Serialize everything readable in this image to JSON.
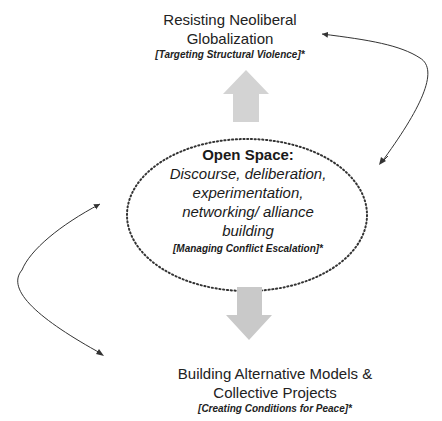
{
  "diagram": {
    "top_node": {
      "title_line1": "Resisting Neoliberal",
      "title_line2": "Globalization",
      "subtitle": "[Targeting Structural Violence]*"
    },
    "center_node": {
      "heading": "Open Space:",
      "body_line1": "Discourse, deliberation,",
      "body_line2": "experimentation,",
      "body_line3": "networking/ alliance",
      "body_line4": "building",
      "subtitle": "[Managing Conflict Escalation]*"
    },
    "bottom_node": {
      "title_line1": "Building Alternative Models &",
      "title_line2": "Collective Projects",
      "subtitle": "[Creating Conditions for Peace]*"
    },
    "colors": {
      "block_arrow": "#d3d3d3",
      "ellipse_border": "#333333",
      "curve": "#333333"
    }
  }
}
